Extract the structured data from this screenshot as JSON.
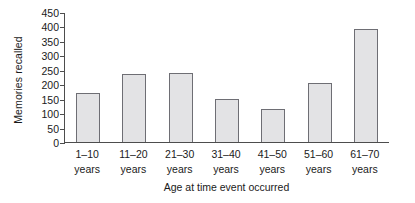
{
  "chart_data": {
    "type": "bar",
    "title": "",
    "xlabel": "Age at time event occurred",
    "ylabel": "Memories recalled",
    "categories": [
      "1–10 years",
      "11–20 years",
      "21–30 years",
      "31–40 years",
      "41–50 years",
      "51–60 years",
      "61–70 years"
    ],
    "category_lines": [
      {
        "range": "1–10",
        "unit": "years"
      },
      {
        "range": "11–20",
        "unit": "years"
      },
      {
        "range": "21–30",
        "unit": "years"
      },
      {
        "range": "31–40",
        "unit": "years"
      },
      {
        "range": "41–50",
        "unit": "years"
      },
      {
        "range": "51–60",
        "unit": "years"
      },
      {
        "range": "61–70",
        "unit": "years"
      }
    ],
    "values": [
      170,
      235,
      240,
      150,
      115,
      205,
      390
    ],
    "ylim": [
      0,
      450
    ],
    "ytick_step": 50,
    "yticks": [
      0,
      50,
      100,
      150,
      200,
      250,
      300,
      350,
      400,
      450
    ],
    "ytick_labels": [
      "0",
      "50",
      "100",
      "150",
      "200",
      "250",
      "300",
      "350",
      "400",
      "450"
    ],
    "grid": false,
    "legend": false,
    "bar_fill_color": "#e3e3e5",
    "bar_border_color": "#6e6e74",
    "axis_color": "#4d4d4d",
    "background_color": "#ffffff"
  }
}
